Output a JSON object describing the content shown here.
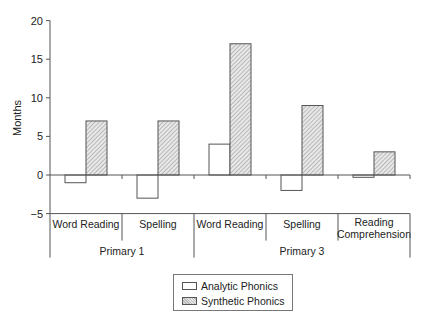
{
  "chart_data": {
    "type": "bar",
    "title": "",
    "xlabel": "",
    "ylabel": "Months",
    "ylim": [
      -5,
      20
    ],
    "yticks": [
      -5,
      0,
      5,
      10,
      15,
      20
    ],
    "grid": false,
    "legend_position": "bottom",
    "groups": [
      {
        "label": "Primary 1",
        "categories": [
          "Word Reading",
          "Spelling"
        ]
      },
      {
        "label": "Primary 3",
        "categories": [
          "Word Reading",
          "Spelling",
          "Reading Comprehension"
        ]
      }
    ],
    "categories": [
      "Primary 1 – Word Reading",
      "Primary 1 – Spelling",
      "Primary 3 – Word Reading",
      "Primary 3 – Spelling",
      "Primary 3 – Reading Comprehension"
    ],
    "category_labels": [
      [
        "Word Reading"
      ],
      [
        "Spelling"
      ],
      [
        "Word Reading"
      ],
      [
        "Spelling"
      ],
      [
        "Reading",
        "Comprehension"
      ]
    ],
    "series": [
      {
        "name": "Analytic Phonics",
        "fill": "white",
        "values": [
          -1,
          -3,
          4,
          -2,
          -0.3
        ]
      },
      {
        "name": "Synthetic Phonics",
        "fill": "hatched",
        "values": [
          7,
          7,
          17,
          9,
          3
        ]
      }
    ]
  },
  "legend": {
    "items": [
      {
        "label": "Analytic Phonics"
      },
      {
        "label": "Synthetic Phonics"
      }
    ]
  },
  "colors": {
    "axis": "#555555",
    "bar_border": "#555555",
    "hatch_dark": "#aaaaaa",
    "hatch_light": "#e8e8e8"
  }
}
